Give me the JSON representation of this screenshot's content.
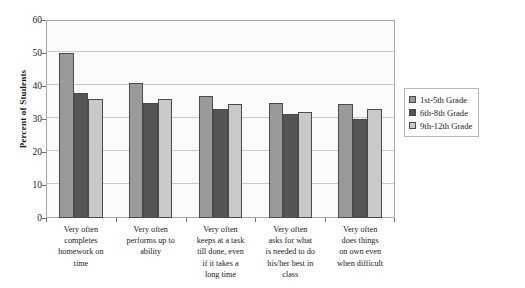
{
  "chart_data": {
    "type": "bar",
    "title": "",
    "xlabel": "",
    "ylabel": "Percent of Students",
    "ylim": [
      0,
      60
    ],
    "ytick_step": 10,
    "yticks": [
      0,
      10,
      20,
      30,
      40,
      50,
      60
    ],
    "grid": true,
    "legend_position": "right",
    "categories": [
      "Very often completes homework on time",
      "Very often performs up to ability",
      "Very often keeps at a task till done, even if it takes a long time",
      "Very often asks for what is needed to do his/her best in class",
      "Very often does things on own even when difficult"
    ],
    "category_lines": [
      [
        "Very often",
        "completes",
        "homework on",
        "time"
      ],
      [
        "Very often",
        "performs up to",
        "ability"
      ],
      [
        "Very often",
        "keeps at a task",
        "till done, even",
        "if it takes a",
        "long time"
      ],
      [
        "Very often",
        "asks for what",
        "is needed to do",
        "his/her best in",
        "class"
      ],
      [
        "Very often",
        "does things",
        "on own even",
        "when difficult"
      ]
    ],
    "series": [
      {
        "name": "1st-5th Grade",
        "color": "#9a9a9a",
        "values": [
          50,
          41,
          37,
          35,
          34.5
        ]
      },
      {
        "name": "6th-8th Grade",
        "color": "#555555",
        "values": [
          38,
          35,
          33,
          31.5,
          30
        ]
      },
      {
        "name": "9th-12th Grade",
        "color": "#c9c9c9",
        "values": [
          36,
          36,
          34.5,
          32,
          33
        ]
      }
    ]
  },
  "legend": {
    "items": [
      {
        "label": "1st-5th Grade"
      },
      {
        "label": "6th-8th Grade"
      },
      {
        "label": "9th-12th Grade"
      }
    ]
  }
}
